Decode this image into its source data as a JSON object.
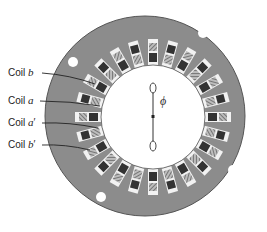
{
  "diagram": {
    "labels": [
      {
        "id": "coil-b",
        "text": "Coil ",
        "symbol": "b",
        "prime": "",
        "x": 8,
        "y": 68
      },
      {
        "id": "coil-a",
        "text": "Coil ",
        "symbol": "a",
        "prime": "",
        "x": 8,
        "y": 96
      },
      {
        "id": "coil-a-prime",
        "text": "Coil ",
        "symbol": "a",
        "prime": "′",
        "x": 8,
        "y": 118
      },
      {
        "id": "coil-b-prime",
        "text": "Coil ",
        "symbol": "b",
        "prime": "′",
        "x": 8,
        "y": 140
      }
    ],
    "flux_symbol": "ϕ",
    "colors": {
      "core": "#8c8c8c",
      "core_edge": "#555555",
      "slot": "#f2f2f2",
      "coil_dark": "#333333",
      "coil_hatch": "#9a9a9a",
      "bore": "#ffffff"
    },
    "slot_count": 24
  }
}
